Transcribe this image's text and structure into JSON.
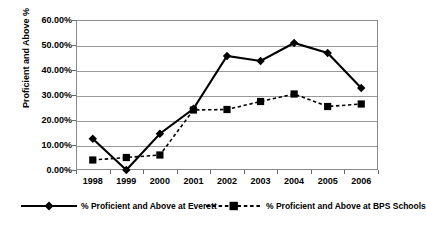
{
  "chart_data": {
    "type": "line",
    "title": "",
    "xlabel": "",
    "ylabel": "Proficient and Above %",
    "categories": [
      "1998",
      "1999",
      "2000",
      "2001",
      "2002",
      "2003",
      "2004",
      "2005",
      "2006"
    ],
    "ylim": [
      0,
      60
    ],
    "ytick_values": [
      0,
      10,
      20,
      30,
      40,
      50,
      60
    ],
    "ytick_labels": [
      "0.00%",
      "10.00%",
      "20.00%",
      "30.00%",
      "40.00%",
      "50.00%",
      "60.00%"
    ],
    "grid": true,
    "legend_position": "bottom",
    "series": [
      {
        "name": "% Proficient and Above at Everett",
        "marker": "diamond",
        "linestyle": "solid",
        "color": "#000000",
        "values": [
          12.5,
          0.0,
          14.5,
          24.5,
          45.6,
          43.6,
          50.8,
          46.8,
          32.8
        ]
      },
      {
        "name": "% Proficient and Above at BPS Schools",
        "marker": "square",
        "linestyle": "dashed",
        "color": "#000000",
        "values": [
          4.0,
          5.0,
          6.0,
          24.0,
          24.2,
          27.4,
          30.4,
          25.4,
          26.4
        ]
      }
    ]
  },
  "legend": {
    "items": [
      {
        "label": "% Proficient and Above at Everett",
        "marker": "diamond-icon",
        "style": "solid"
      },
      {
        "label": "% Proficient and Above at BPS Schools",
        "marker": "square-icon",
        "style": "dashed"
      }
    ]
  },
  "axes": {
    "y_title": "Proficient and Above %"
  }
}
